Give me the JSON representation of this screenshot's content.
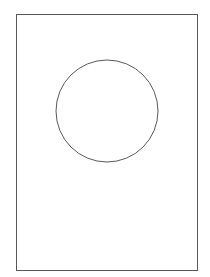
{
  "figure": {
    "background": "#ffffff",
    "stroke_color": "#5a5a5a",
    "page": {
      "shape": "rectangle",
      "x": 16,
      "y": 14,
      "width": 181,
      "height": 256
    },
    "circle": {
      "shape": "circle",
      "cx": 107,
      "cy": 111,
      "r": 51
    }
  }
}
